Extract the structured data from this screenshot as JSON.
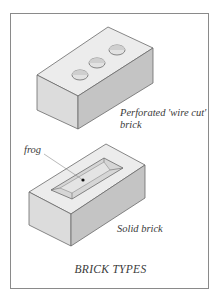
{
  "figure": {
    "caption": "BRICK TYPES",
    "colors": {
      "frame_border": "#8a8a8a",
      "brick_top": "#ececec",
      "brick_left_face": "#dcdcdc",
      "brick_right_face": "#c4c4c4",
      "outline": "#6a6a6a",
      "text": "#3a3a3a"
    }
  },
  "bricks": [
    {
      "name": "perforated-brick",
      "label_line1": "Perforated 'wire cut'",
      "label_line2": "brick",
      "holes": 3
    },
    {
      "name": "solid-brick",
      "label": "Solid brick",
      "callout": "frog"
    }
  ]
}
